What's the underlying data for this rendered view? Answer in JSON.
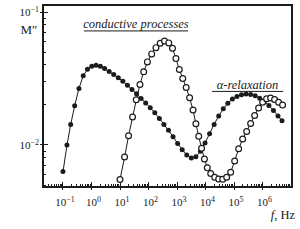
{
  "figure": {
    "background": "#ffffff",
    "ink_color": "#1b1b1b"
  },
  "chart_data": {
    "type": "line",
    "title": "",
    "xlabel": "f, Hz",
    "ylabel": "M″",
    "x_scale": "log",
    "y_scale": "log",
    "x_range_log10": [
      -1.7,
      7.03
    ],
    "y_range_log10": [
      -2.316,
      -0.947
    ],
    "x_tick_exponents": [
      -1,
      0,
      1,
      2,
      3,
      4,
      5,
      6
    ],
    "y_tick_exponents": [
      -1,
      -2
    ],
    "grid": false,
    "legend": "none",
    "annotations": [
      {
        "text": "conductive processes",
        "center_u": 1.56,
        "baseline_v": -1.12,
        "underline_u": [
          -0.263,
          3.386
        ],
        "underline_v": -1.142
      },
      {
        "text": "α-relaxation",
        "center_u": 5.47,
        "baseline_v": -1.579,
        "underline_u": [
          4.228,
          6.719
        ],
        "underline_v": -1.597
      }
    ],
    "series": [
      {
        "name": "filled-circles",
        "marker": "filled-circle",
        "points_log10": [
          [
            -1.0,
            -2.2
          ],
          [
            -0.86,
            -2.0
          ],
          [
            -0.73,
            -1.845
          ],
          [
            -0.59,
            -1.705
          ],
          [
            -0.44,
            -1.575
          ],
          [
            -0.29,
            -1.48
          ],
          [
            -0.14,
            -1.43
          ],
          [
            0.01,
            -1.408
          ],
          [
            0.16,
            -1.4
          ],
          [
            0.31,
            -1.408
          ],
          [
            0.46,
            -1.425
          ],
          [
            0.62,
            -1.447
          ],
          [
            0.78,
            -1.47
          ],
          [
            0.94,
            -1.495
          ],
          [
            1.1,
            -1.52
          ],
          [
            1.26,
            -1.55
          ],
          [
            1.42,
            -1.582
          ],
          [
            1.58,
            -1.615
          ],
          [
            1.74,
            -1.65
          ],
          [
            1.9,
            -1.685
          ],
          [
            2.06,
            -1.72
          ],
          [
            2.22,
            -1.758
          ],
          [
            2.38,
            -1.8
          ],
          [
            2.54,
            -1.845
          ],
          [
            2.7,
            -1.89
          ],
          [
            2.86,
            -1.938
          ],
          [
            3.02,
            -1.988
          ],
          [
            3.18,
            -2.035
          ],
          [
            3.34,
            -2.075
          ],
          [
            3.5,
            -2.098
          ],
          [
            3.66,
            -2.088
          ],
          [
            3.82,
            -2.048
          ],
          [
            3.98,
            -1.985
          ],
          [
            4.14,
            -1.915
          ],
          [
            4.3,
            -1.845
          ],
          [
            4.46,
            -1.782
          ],
          [
            4.62,
            -1.728
          ],
          [
            4.78,
            -1.686
          ],
          [
            4.94,
            -1.655
          ],
          [
            5.1,
            -1.635
          ],
          [
            5.26,
            -1.622
          ],
          [
            5.42,
            -1.617
          ],
          [
            5.58,
            -1.62
          ],
          [
            5.74,
            -1.63
          ],
          [
            5.9,
            -1.648
          ],
          [
            6.06,
            -1.672
          ],
          [
            6.22,
            -1.703
          ],
          [
            6.38,
            -1.74
          ],
          [
            6.54,
            -1.782
          ],
          [
            6.68,
            -1.818
          ]
        ]
      },
      {
        "name": "open-circles",
        "marker": "open-circle",
        "points_log10": [
          [
            1.0,
            -2.26
          ],
          [
            1.16,
            -2.09
          ],
          [
            1.3,
            -1.93
          ],
          [
            1.44,
            -1.79
          ],
          [
            1.57,
            -1.66
          ],
          [
            1.7,
            -1.545
          ],
          [
            1.83,
            -1.45
          ],
          [
            1.96,
            -1.375
          ],
          [
            2.11,
            -1.315
          ],
          [
            2.26,
            -1.268
          ],
          [
            2.41,
            -1.235
          ],
          [
            2.56,
            -1.218
          ],
          [
            2.71,
            -1.232
          ],
          [
            2.84,
            -1.272
          ],
          [
            2.96,
            -1.35
          ],
          [
            3.08,
            -1.432
          ],
          [
            3.2,
            -1.5
          ],
          [
            3.32,
            -1.568
          ],
          [
            3.44,
            -1.645
          ],
          [
            3.56,
            -1.737
          ],
          [
            3.66,
            -1.84
          ],
          [
            3.76,
            -1.935
          ],
          [
            3.86,
            -2.025
          ],
          [
            3.96,
            -2.105
          ],
          [
            4.06,
            -2.172
          ],
          [
            4.18,
            -2.215
          ],
          [
            4.32,
            -2.243
          ],
          [
            4.46,
            -2.256
          ],
          [
            4.6,
            -2.258
          ],
          [
            4.74,
            -2.243
          ],
          [
            4.88,
            -2.205
          ],
          [
            5.02,
            -2.12
          ],
          [
            5.16,
            -2.028
          ],
          [
            5.3,
            -1.955
          ],
          [
            5.44,
            -1.898
          ],
          [
            5.58,
            -1.838
          ],
          [
            5.72,
            -1.778
          ],
          [
            5.86,
            -1.722
          ],
          [
            6.0,
            -1.678
          ],
          [
            6.14,
            -1.652
          ],
          [
            6.28,
            -1.647
          ],
          [
            6.42,
            -1.658
          ],
          [
            6.56,
            -1.678
          ],
          [
            6.7,
            -1.7
          ]
        ]
      }
    ]
  }
}
